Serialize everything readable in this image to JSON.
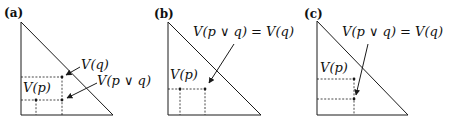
{
  "figure": {
    "panels": [
      {
        "label": "(a)",
        "annotations": {
          "vp": "V(p)",
          "vq": "V(q)",
          "vpq": "V(p ∨ q)"
        }
      },
      {
        "label": "(b)",
        "annotations": {
          "vp": "V(p)",
          "vpq_eq": "V(p ∨ q) = V(q)"
        }
      },
      {
        "label": "(c)",
        "annotations": {
          "vp": "V(p)",
          "vpq_eq": "V(p ∨ q) = V(q)"
        }
      }
    ],
    "colors": {
      "ink": "#1a1a1a",
      "background": "#ffffff"
    }
  }
}
